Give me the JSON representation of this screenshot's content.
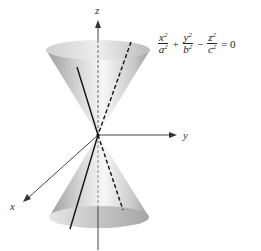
{
  "diagram": {
    "axes": {
      "z_label": "z",
      "y_label": "y",
      "x_label": "x"
    },
    "equation": {
      "terms": [
        {
          "num": "x",
          "den": "a",
          "exp": "2"
        },
        {
          "op": "+"
        },
        {
          "num": "y",
          "den": "b",
          "exp": "2"
        },
        {
          "op": "−"
        },
        {
          "num": "z",
          "den": "c",
          "exp": "2"
        }
      ],
      "rhs": "= 0"
    },
    "colors": {
      "cone_light": "#f4f4f4",
      "cone_dark": "#a8a8a8",
      "line": "#111111",
      "axis": "#444444"
    }
  }
}
